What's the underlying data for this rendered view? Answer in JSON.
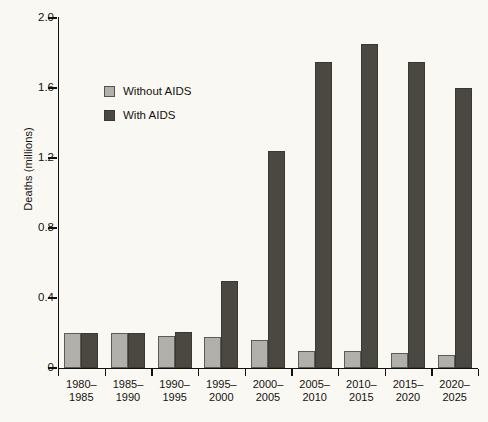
{
  "chart_data": {
    "type": "bar",
    "title": "",
    "subtitle": "",
    "xlabel": "",
    "ylabel": "Deaths (millions)",
    "ylim": [
      0,
      2.0
    ],
    "yticks": [
      0,
      0.4,
      0.8,
      1.2,
      1.6,
      2.0
    ],
    "ytick_labels": [
      "0",
      "0.4",
      "0.8",
      "1.2",
      "1.6",
      "2.0"
    ],
    "grid": false,
    "legend_position": "upper-left-inside",
    "categories": [
      "1980–\n1985",
      "1985–\n1990",
      "1990–\n1995",
      "1995–\n2000",
      "2000–\n2005",
      "2005–\n2010",
      "2010–\n2015",
      "2015–\n2020",
      "2020–\n2025"
    ],
    "category_lines": [
      [
        "1980–",
        "1985"
      ],
      [
        "1985–",
        "1990"
      ],
      [
        "1990–",
        "1995"
      ],
      [
        "1995–",
        "2000"
      ],
      [
        "2000–",
        "2005"
      ],
      [
        "2005–",
        "2010"
      ],
      [
        "2010–",
        "2015"
      ],
      [
        "2015–",
        "2020"
      ],
      [
        "2020–",
        "2025"
      ]
    ],
    "series": [
      {
        "name": "Without AIDS",
        "color": "#b2b0aa",
        "values": [
          0.2,
          0.2,
          0.185,
          0.175,
          0.16,
          0.1,
          0.095,
          0.085,
          0.075
        ]
      },
      {
        "name": "With AIDS",
        "color": "#4b4842",
        "values": [
          0.2,
          0.2,
          0.205,
          0.5,
          1.24,
          1.75,
          1.85,
          1.75,
          1.6
        ]
      }
    ]
  },
  "legend": {
    "items": [
      {
        "label": "Without AIDS",
        "swatch": "without"
      },
      {
        "label": "With AIDS",
        "swatch": "with"
      }
    ]
  },
  "colors": {
    "background": "#faf8f3",
    "axis": "#14120f",
    "series_without_aids": "#b2b0aa",
    "series_with_aids": "#4b4842"
  }
}
